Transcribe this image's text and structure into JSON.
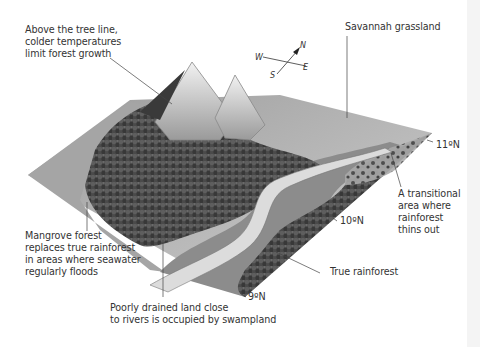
{
  "diagram": {
    "colors": {
      "background": "#ffffff",
      "true_rainforest": "#4a4a4a",
      "swampland": "#8c8c8c",
      "river": "#d6d6d6",
      "savannah": "#bdbdbd",
      "mangrove": "#a8a8a8",
      "mountain": "#e2e2e2",
      "text": "#333333",
      "leader_line": "#444444"
    },
    "compass": {
      "n": "N",
      "e": "E",
      "s": "S",
      "w": "W"
    },
    "latitudes": [
      {
        "label": "9ºN"
      },
      {
        "label": "10ºN"
      },
      {
        "label": "11ºN"
      }
    ],
    "labels": {
      "tree_line": "Above the tree line,\ncolder temperatures\nlimit forest growth",
      "savannah": "Savannah grassland",
      "transitional": "A transitional\narea where\nrainforest\nthins out",
      "mangrove": "Mangrove forest\nreplaces true rainforest\nin areas where seawater\nregularly floods",
      "swampland": "Poorly drained land close\nto rivers is occupied by swampland",
      "true_rainforest": "True rainforest"
    }
  }
}
